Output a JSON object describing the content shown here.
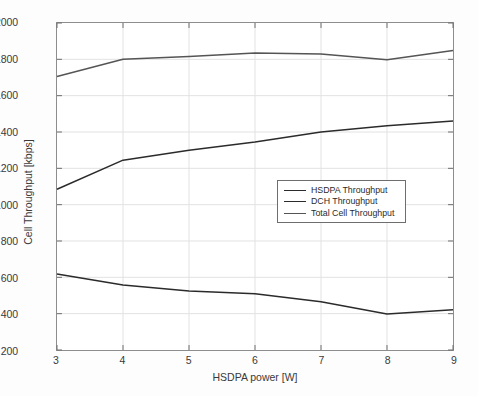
{
  "chart_data": {
    "type": "line",
    "title": "",
    "xlabel": "HSDPA power [W]",
    "ylabel": "Cell Throughput [kbps]",
    "x": [
      3,
      4,
      5,
      6,
      7,
      8,
      9
    ],
    "xlim": [
      3,
      9
    ],
    "ylim": [
      200,
      2000
    ],
    "xticks": [
      "3",
      "4",
      "5",
      "6",
      "7",
      "8",
      "9"
    ],
    "yticks": [
      "200",
      "400",
      "600",
      "800",
      "1000",
      "1200",
      "1400",
      "1600",
      "1800",
      "2000"
    ],
    "grid": true,
    "legend_position": "center-right",
    "series": [
      {
        "name": "HSDPA Throughput",
        "color": "#2b2b2b",
        "values": [
          1085,
          1245,
          1300,
          1345,
          1400,
          1435,
          1460
        ]
      },
      {
        "name": "DCH Throughput",
        "color": "#2b2b2b",
        "values": [
          618,
          558,
          525,
          510,
          465,
          398,
          422
        ]
      },
      {
        "name": "Total Cell Throughput",
        "color": "#555555",
        "values": [
          1705,
          1800,
          1815,
          1835,
          1830,
          1798,
          1848
        ]
      }
    ]
  },
  "legend": {
    "items": [
      {
        "label": "HSDPA Throughput"
      },
      {
        "label": "DCH Throughput"
      },
      {
        "label": "Total Cell Throughput"
      }
    ]
  },
  "axes": {
    "x_title": "HSDPA power [W]",
    "y_title": "Cell Throughput [kbps]"
  }
}
